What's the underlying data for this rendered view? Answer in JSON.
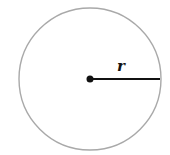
{
  "diagram": {
    "circle": {
      "cx": 90,
      "cy": 79,
      "r": 71,
      "stroke": "#a9a9a9",
      "fill": "#ffffff"
    },
    "center_point": {
      "cx": 90,
      "cy": 79,
      "r": 3.5,
      "fill": "#111111"
    },
    "radius_line": {
      "x1": 90,
      "y1": 79,
      "x2": 160,
      "y2": 79,
      "stroke": "#111111"
    },
    "radius_label": "r"
  }
}
